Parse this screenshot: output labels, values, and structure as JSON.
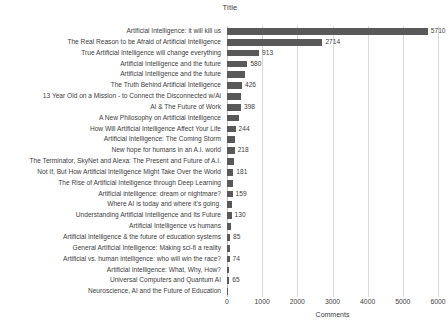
{
  "chart_data": {
    "type": "bar",
    "orientation": "horizontal",
    "title": "Title",
    "xlabel": "Comments",
    "ylabel": "",
    "xlim": [
      0,
      6000
    ],
    "xticks": [
      0,
      1000,
      2000,
      3000,
      4000,
      5000,
      6000
    ],
    "xtick_labels": [
      "0",
      "1000",
      "2000",
      "3000",
      "4000",
      "5000",
      "6000"
    ],
    "grid": "vertical",
    "legend": "none",
    "bar_color": "#595959",
    "gridline_color": "#d9d9d9",
    "categories": [
      "Artificial Intelligence: it will kill us",
      "The Real Reason to be Afraid of Artificial Intelligence",
      "True Artificial Intelligence will change everything",
      "Artificial Intelligence and the future",
      "Artificial Intelligence and the future",
      "The Truth Behind Artificial Intelligence",
      "13 Year Old on a Mission - to Connect the Disconnected w/Ai",
      "AI & The Future of Work",
      "A New Philosophy on Artificial Intelligence",
      "How Will Artificial Intelligence Affect Your Life",
      "Artificial Intelligence: The Coming Storm",
      "New hope for humans in an A.I. world",
      "The Terminator, SkyNet and Alexa: The Present and Future of A.I.",
      "Not If, But How Artificial Intelligence Might Take Over the World",
      "The Rise of Artificial Intelligence through Deep Learning",
      "Artificial intelligence: dream or nightmare?",
      "Where AI is today and where it's going.",
      "Understanding Artificial Intelligence and Its Future",
      "Artificial Intelligence vs humans",
      "Artificial Intelligence & the future of education systems",
      "General Artificial Intelligence: Making sci-fi a reality",
      "Artificial vs. human intelligence: who will win the race?",
      "Artificial Intelligence: What, Why, How?",
      "Universal Computers and Quantum AI",
      "Neuroscience, AI and the Future of Education"
    ],
    "values": [
      5710,
      2714,
      913,
      580,
      520,
      426,
      410,
      398,
      330,
      244,
      232,
      218,
      200,
      181,
      168,
      159,
      142,
      130,
      104,
      85,
      79,
      74,
      69,
      65,
      40
    ],
    "value_labels": [
      "5710",
      "2714",
      "913",
      "580",
      "",
      "426",
      "",
      "398",
      "",
      "244",
      "",
      "218",
      "",
      "181",
      "",
      "159",
      "",
      "130",
      "",
      "85",
      "",
      "74",
      "",
      "65",
      ""
    ]
  }
}
